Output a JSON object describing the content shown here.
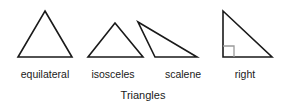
{
  "diagram": {
    "caption": "Triangles",
    "background_color": "#ffffff",
    "stroke_color": "#1a1a1a",
    "marker_color": "#9a9a9a",
    "shapes": [
      {
        "name": "equilateral-triangle",
        "label": "equilateral",
        "label_x": 45,
        "label_y": 78,
        "points": "45,11 72,57 18,57",
        "has_right_angle_mark": false
      },
      {
        "name": "isosceles-triangle",
        "label": "isosceles",
        "label_x": 113,
        "label_y": 78,
        "points": "115,23 143,57 88,57",
        "has_right_angle_mark": false
      },
      {
        "name": "scalene-triangle",
        "label": "scalene",
        "label_x": 183,
        "label_y": 78,
        "points": "138,22 197,57 155,57",
        "has_right_angle_mark": false
      },
      {
        "name": "right-triangle",
        "label": "right",
        "label_x": 245,
        "label_y": 78,
        "points": "223,11 272,57 223,57",
        "has_right_angle_mark": true,
        "right_angle_mark": "234,57 234,46 223,46"
      }
    ],
    "caption_x": 143,
    "caption_y": 99
  }
}
